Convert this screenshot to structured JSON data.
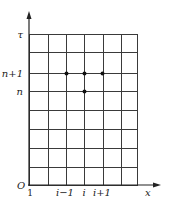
{
  "diagram": {
    "type": "finite-difference-grid",
    "axes": {
      "x_label": "x",
      "y_label": "τ",
      "origin_label": "O"
    },
    "grid": {
      "columns": 6,
      "rows": 8,
      "left": 29,
      "right": 137,
      "top": 34,
      "bottom": 185,
      "x_lines": [
        29,
        48,
        66,
        84,
        103,
        121,
        137
      ],
      "y_lines": [
        34,
        52,
        73,
        91,
        110,
        129,
        148,
        167,
        185
      ]
    },
    "x_ticks": [
      {
        "label": "1",
        "x": 30
      },
      {
        "label": "i−1",
        "x": 65
      },
      {
        "label": "i",
        "x": 84
      },
      {
        "label": "i+1",
        "x": 102
      }
    ],
    "y_ticks": [
      {
        "label": "τ",
        "y": 34
      },
      {
        "label": "n+1",
        "y": 73
      },
      {
        "label": "n",
        "y": 91
      }
    ],
    "nodes": [
      {
        "name": "node-i-minus-1-n-plus-1",
        "x": 66,
        "y": 73
      },
      {
        "name": "node-i-n-plus-1",
        "x": 84,
        "y": 73
      },
      {
        "name": "node-i-plus-1-n-plus-1",
        "x": 102,
        "y": 73
      },
      {
        "name": "node-i-n",
        "x": 84,
        "y": 91
      }
    ]
  }
}
